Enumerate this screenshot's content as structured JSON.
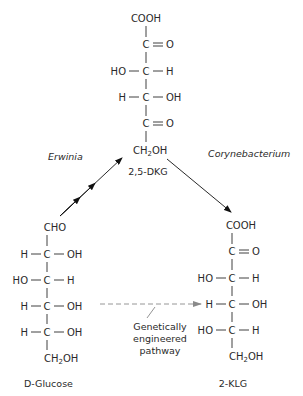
{
  "diagram": {
    "top_molecule": {
      "name": "2,5-DKG",
      "rows": [
        {
          "left": "",
          "center": "COOH",
          "right": ""
        },
        {
          "left": "",
          "center": "C",
          "right": "=O"
        },
        {
          "left": "HO",
          "center": "C",
          "right": "H"
        },
        {
          "left": "H",
          "center": "C",
          "right": "OH"
        },
        {
          "left": "",
          "center": "C",
          "right": "=O"
        },
        {
          "left": "",
          "center": "CH2OH",
          "right": ""
        }
      ]
    },
    "left_molecule": {
      "name": "D-Glucose",
      "rows": [
        {
          "left": "",
          "center": "CHO",
          "right": ""
        },
        {
          "left": "H",
          "center": "C",
          "right": "OH"
        },
        {
          "left": "HO",
          "center": "C",
          "right": "H"
        },
        {
          "left": "H",
          "center": "C",
          "right": "OH"
        },
        {
          "left": "H",
          "center": "C",
          "right": "OH"
        },
        {
          "left": "",
          "center": "CH2OH",
          "right": ""
        }
      ]
    },
    "right_molecule": {
      "name": "2-KLG",
      "rows": [
        {
          "left": "",
          "center": "COOH",
          "right": ""
        },
        {
          "left": "",
          "center": "C",
          "right": "=O"
        },
        {
          "left": "HO",
          "center": "C",
          "right": "H"
        },
        {
          "left": "H",
          "center": "C",
          "right": "OH"
        },
        {
          "left": "HO",
          "center": "C",
          "right": "H"
        },
        {
          "left": "",
          "center": "CH2OH",
          "right": ""
        }
      ]
    },
    "arrows": {
      "erwinia": {
        "label": "Erwinia",
        "from": "D-Glucose",
        "to": "2,5-DKG",
        "style": "solid, double arrowhead"
      },
      "corynebacterium": {
        "label": "Corynebacterium",
        "from": "2,5-DKG",
        "to": "2-KLG",
        "style": "solid"
      },
      "engineered": {
        "label_lines": [
          "Genetically",
          "engineered",
          "pathway"
        ],
        "from": "D-Glucose",
        "to": "2-KLG",
        "style": "dashed",
        "color": "#8a8a8a"
      }
    },
    "text": {
      "cooh": "COOH",
      "cho": "CHO",
      "c": "C",
      "o": "O",
      "h": "H",
      "ho": "HO",
      "oh": "OH",
      "ch": "CH",
      "sub2": "2",
      "top_label": "2,5-DKG",
      "left_label": "D-Glucose",
      "right_label": "2-KLG",
      "erwinia": "Erwinia",
      "corynebacterium": "Corynebacterium",
      "ge_line1": "Genetically",
      "ge_line2": "engineered",
      "ge_line3": "pathway"
    }
  }
}
